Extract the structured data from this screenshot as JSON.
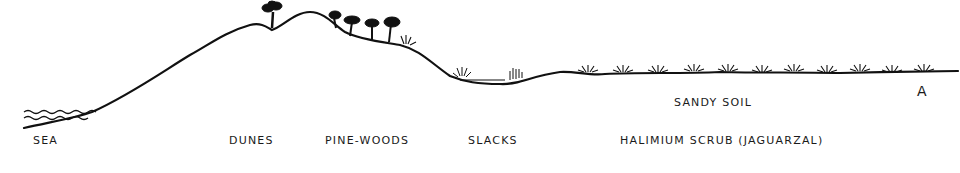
{
  "diagram": {
    "ink_color": "#111111",
    "background": "#ffffff",
    "zones": [
      {
        "id": "sea",
        "label": "SEA"
      },
      {
        "id": "dunes",
        "label": "DUNES"
      },
      {
        "id": "pine-woods",
        "label": "PINE-WOODS"
      },
      {
        "id": "slacks",
        "label": "SLACKS"
      },
      {
        "id": "scrub",
        "label": "HALIMIUM SCRUB (JAGUARZAL)"
      }
    ],
    "annotations": {
      "soil": "SANDY SOIL",
      "endpoint": "A"
    }
  }
}
